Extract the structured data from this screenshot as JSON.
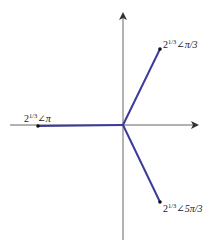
{
  "diagram": {
    "type": "complex-plane-roots",
    "colors": {
      "axis": "#555555",
      "root_line": "#3b3b9a",
      "point": "#111111",
      "label": "#222222"
    },
    "origin": {
      "x": 123,
      "y": 125
    },
    "axes": {
      "horizontal": {
        "x1": 10,
        "x2": 198,
        "y": 125
      },
      "vertical": {
        "x": 123,
        "y1": 13,
        "y2": 240
      }
    },
    "roots": [
      {
        "modulus_base": "2",
        "modulus_exp": "1/3",
        "angle": "π/3",
        "x": 160,
        "y": 49
      },
      {
        "modulus_base": "2",
        "modulus_exp": "1/3",
        "angle": "π",
        "x": 38,
        "y": 126
      },
      {
        "modulus_base": "2",
        "modulus_exp": "1/3",
        "angle": "5π/3",
        "x": 160,
        "y": 202
      }
    ],
    "angle_symbol": "∠"
  }
}
